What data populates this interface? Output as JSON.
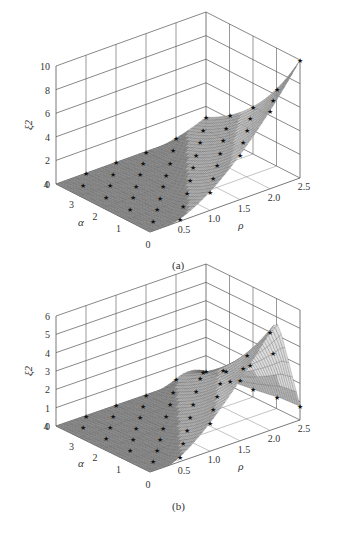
{
  "figures": [
    {
      "id": "a",
      "caption": "(a)",
      "zlabel": "ξ2",
      "xlabel": "ρ",
      "ylabel": "α",
      "zticks": [
        "0",
        "2",
        "4",
        "6",
        "8",
        "10"
      ],
      "xticks": [
        "0",
        "0.5",
        "1.0",
        "1.5",
        "2.0",
        "2.5"
      ],
      "yticks": [
        "1",
        "2",
        "3",
        "4"
      ]
    },
    {
      "id": "b",
      "caption": "(b)",
      "zlabel": "ξ2",
      "xlabel": "ρ",
      "ylabel": "α",
      "zticks": [
        "0",
        "1",
        "2",
        "3",
        "4",
        "5",
        "6"
      ],
      "xticks": [
        "0",
        "0.5",
        "1.0",
        "1.5",
        "2.0",
        "2.5"
      ],
      "yticks": [
        "1",
        "2",
        "3",
        "4"
      ]
    }
  ],
  "chart_data": [
    {
      "type": "surface3d",
      "title": "(a)",
      "xlabel": "ρ",
      "ylabel": "α",
      "zlabel": "ξ2",
      "xlim": [
        0,
        2.5
      ],
      "ylim": [
        0,
        4
      ],
      "zlim": [
        0,
        10
      ],
      "x_ticks": [
        0,
        0.5,
        1.0,
        1.5,
        2.0,
        2.5
      ],
      "y_ticks": [
        1,
        2,
        3,
        4
      ],
      "z_ticks": [
        0,
        2,
        4,
        6,
        8,
        10
      ],
      "grid": true,
      "series": [
        {
          "name": "surface",
          "style": "mesh"
        },
        {
          "name": "markers",
          "marker": "star",
          "description": "star markers on grid points; surface ~0 for small ρ or large α, peak ≈10 near ρ≈2.5, α≈0"
        }
      ],
      "peak": {
        "x": 2.5,
        "y": 0,
        "z": 10
      }
    },
    {
      "type": "surface3d",
      "title": "(b)",
      "xlabel": "ρ",
      "ylabel": "α",
      "zlabel": "ξ2",
      "xlim": [
        0,
        2.5
      ],
      "ylim": [
        0,
        4
      ],
      "zlim": [
        0,
        6
      ],
      "x_ticks": [
        0,
        0.5,
        1.0,
        1.5,
        2.0,
        2.5
      ],
      "y_ticks": [
        1,
        2,
        3,
        4
      ],
      "z_ticks": [
        0,
        1,
        2,
        3,
        4,
        5,
        6
      ],
      "grid": true,
      "series": [
        {
          "name": "surface",
          "style": "mesh"
        },
        {
          "name": "markers",
          "marker": "star",
          "description": "star markers on grid points; surface ~0 for small ρ or large α, peak ≈6.3 near ρ≈2.0–2.5, α≈0"
        }
      ],
      "peak": {
        "x": 2.3,
        "y": 0,
        "z": 6.3
      }
    }
  ]
}
